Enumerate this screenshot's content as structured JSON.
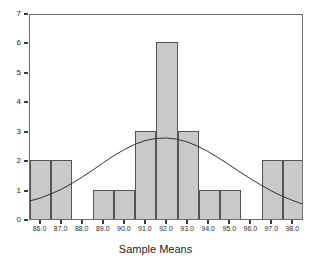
{
  "chart_data": {
    "type": "bar",
    "title": "",
    "subtitle": "",
    "xlabel": "Sample Means",
    "ylabel": "",
    "xlim": [
      85.5,
      98.5
    ],
    "ylim": [
      0,
      7
    ],
    "grid": false,
    "legend": null,
    "bin_width": 1.0,
    "x_tick_labels": [
      "86.0",
      "87.0",
      "88.0",
      "89.0",
      "90.0",
      "91.0",
      "92.0",
      "93.0",
      "94.0",
      "95.0",
      "96.0",
      "97.0",
      "98.0"
    ],
    "x_tick_values": [
      86.0,
      87.0,
      88.0,
      89.0,
      90.0,
      91.0,
      92.0,
      93.0,
      94.0,
      95.0,
      96.0,
      97.0,
      98.0
    ],
    "y_tick_labels": [
      "0",
      "1",
      "2",
      "3",
      "4",
      "5",
      "6",
      "7"
    ],
    "y_tick_values": [
      0,
      1,
      2,
      3,
      4,
      5,
      6,
      7
    ],
    "categories": [
      "85.5-86.5",
      "86.5-87.5",
      "87.5-88.5",
      "88.5-89.5",
      "89.5-90.5",
      "90.5-91.5",
      "91.5-92.5",
      "92.5-93.5",
      "93.5-94.5",
      "94.5-95.5",
      "95.5-96.5",
      "96.5-97.5",
      "97.5-98.5"
    ],
    "bin_centers": [
      86.0,
      87.0,
      88.0,
      89.0,
      90.0,
      91.0,
      92.0,
      93.0,
      94.0,
      95.0,
      96.0,
      97.0,
      98.0
    ],
    "values": [
      2,
      2,
      0,
      1,
      1,
      3,
      6,
      3,
      1,
      1,
      0,
      2,
      2
    ],
    "overlay_curve": {
      "name": "normal-curve",
      "type": "line",
      "peak_x": 92.2,
      "peak_y": 2.78,
      "x": [
        85.5,
        86.0,
        86.5,
        87.0,
        87.5,
        88.0,
        88.5,
        89.0,
        89.5,
        90.0,
        90.5,
        91.0,
        91.5,
        92.0,
        92.5,
        93.0,
        93.5,
        94.0,
        94.5,
        95.0,
        95.5,
        96.0,
        96.5,
        97.0,
        97.5,
        98.0,
        98.5
      ],
      "y": [
        0.62,
        0.72,
        0.86,
        1.02,
        1.22,
        1.44,
        1.68,
        1.93,
        2.17,
        2.38,
        2.56,
        2.69,
        2.76,
        2.78,
        2.74,
        2.65,
        2.5,
        2.32,
        2.1,
        1.87,
        1.63,
        1.4,
        1.18,
        0.98,
        0.8,
        0.65,
        0.52
      ]
    }
  },
  "axis_title": {
    "x": "Sample Means"
  },
  "colors": {
    "bar_fill": "#c9c9c9",
    "bar_stroke": "#555555",
    "frame": "#6e6e6e",
    "curve": "#303030",
    "tick": "#3a3a3a",
    "text": "#2a2a2a"
  }
}
